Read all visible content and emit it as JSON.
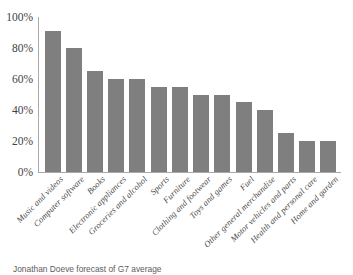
{
  "chart_data": {
    "type": "bar",
    "title": "",
    "subtitle": "",
    "xlabel": "",
    "ylabel": "",
    "ylim": [
      0,
      100
    ],
    "y_tick_labels": [
      "100%",
      "80%",
      "60%",
      "40%",
      "20%",
      "0%"
    ],
    "y_ticks": [
      100,
      80,
      60,
      40,
      20,
      0
    ],
    "grid": false,
    "legend": false,
    "bar_color": "#7f7f7f",
    "background_color": "#ffffff",
    "axis_color": "#aaaaaa",
    "categories": [
      "Music and videos",
      "Computer software",
      "Books",
      "Electronic appliances",
      "Groceries and alcohol",
      "Sports",
      "Furniture",
      "Clothing and footwear",
      "Toys and games",
      "Fuel",
      "Other general merchandise",
      "Motor vehicles and parts",
      "Health and personal care",
      "Home and garden"
    ],
    "values": [
      91,
      80,
      65,
      60,
      60,
      55,
      55,
      50,
      50,
      45,
      40,
      25,
      20,
      20
    ],
    "source_note": "Jonathan Doeve forecast of G7 average"
  }
}
